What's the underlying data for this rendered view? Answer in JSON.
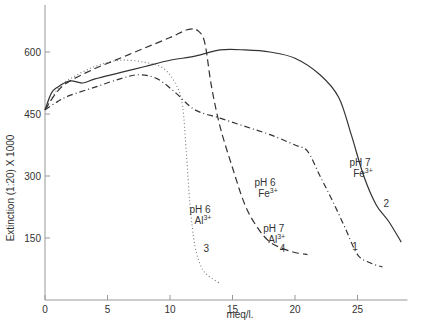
{
  "chart_data": {
    "type": "line",
    "title": "",
    "xlabel": "meq/l.",
    "ylabel": "Extinction (1:20) X 1000",
    "xlim": [
      0,
      29
    ],
    "ylim": [
      0,
      700
    ],
    "x_ticks": [
      0,
      5,
      10,
      15,
      20,
      25
    ],
    "y_ticks": [
      150,
      300,
      450,
      600
    ],
    "grid": false,
    "legend": "inline labels",
    "series": [
      {
        "id": "1",
        "name": "pH 6 Fe3+",
        "style": "dash-dot",
        "x": [
          0,
          1,
          2,
          4,
          6,
          7.5,
          9,
          10.5,
          12,
          14,
          16,
          18,
          20,
          21,
          22,
          23,
          24,
          25,
          26,
          27
        ],
        "y": [
          460,
          480,
          495,
          515,
          535,
          545,
          535,
          500,
          460,
          440,
          420,
          400,
          375,
          360,
          300,
          240,
          175,
          110,
          90,
          80
        ]
      },
      {
        "id": "2",
        "name": "pH 7 Fe3+",
        "style": "solid",
        "x": [
          0,
          0.5,
          1,
          2,
          3,
          4,
          6,
          8,
          10,
          12,
          14,
          16,
          18,
          20,
          22,
          23.5,
          24.5,
          25.5,
          26.5,
          27.5,
          28.5
        ],
        "y": [
          460,
          500,
          515,
          530,
          525,
          535,
          550,
          565,
          580,
          590,
          605,
          605,
          600,
          585,
          545,
          490,
          400,
          300,
          230,
          190,
          140
        ]
      },
      {
        "id": "3",
        "name": "pH 6 Al3+",
        "style": "dotted",
        "x": [
          0,
          1,
          2,
          4,
          6,
          8,
          9.5,
          10.5,
          11,
          11.3,
          11.6,
          12,
          12.5,
          13,
          14
        ],
        "y": [
          460,
          510,
          535,
          565,
          580,
          575,
          560,
          520,
          470,
          360,
          230,
          130,
          80,
          60,
          40
        ]
      },
      {
        "id": "4",
        "name": "pH 7 Al3+",
        "style": "dashed",
        "x": [
          0,
          1,
          2,
          4,
          6,
          8,
          10,
          11.5,
          12.3,
          12.8,
          13.3,
          14,
          15,
          16,
          17,
          18,
          19,
          20,
          21
        ],
        "y": [
          460,
          505,
          530,
          560,
          585,
          610,
          635,
          655,
          650,
          620,
          520,
          420,
          320,
          230,
          175,
          140,
          125,
          115,
          110
        ]
      }
    ],
    "annotations": [
      {
        "text": "pH 7",
        "sub": "Fe3+",
        "curve": "2",
        "x": 25.2,
        "y": 325
      },
      {
        "text": "pH 6",
        "sub": "Fe3+",
        "curve": "1",
        "x": 17.6,
        "y": 275
      },
      {
        "text": "pH 6",
        "sub": "Al3+",
        "curve": "3",
        "x": 12.4,
        "y": 210
      },
      {
        "text": "pH 7",
        "sub": "Al3+",
        "curve": "4",
        "x": 18.3,
        "y": 165
      },
      {
        "text": "1",
        "curve": "1",
        "x": 24.8,
        "y": 120
      },
      {
        "text": "2",
        "curve": "2",
        "x": 27.3,
        "y": 225
      },
      {
        "text": "3",
        "curve": "3",
        "x": 12.9,
        "y": 115
      },
      {
        "text": "4",
        "curve": "4",
        "x": 19.0,
        "y": 115
      }
    ]
  },
  "labels": {
    "xlabel": "meq/l.",
    "ylabel": "Extinction (1:20) X 1000"
  }
}
